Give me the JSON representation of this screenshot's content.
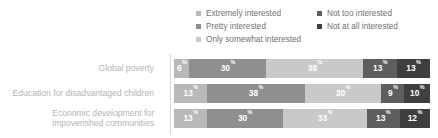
{
  "legend": {
    "columns": [
      {
        "items": [
          {
            "label": "Extremely interested",
            "color": "#b9b9b9"
          },
          {
            "label": "Pretty interested",
            "color": "#8f8f8f"
          },
          {
            "label": "Only somewhat interested",
            "color": "#c9c9c9"
          }
        ]
      },
      {
        "items": [
          {
            "label": "Not too interested",
            "color": "#5e5e5e"
          },
          {
            "label": "Not at all interested",
            "color": "#3f3f3f"
          }
        ]
      }
    ]
  },
  "chart_data": {
    "type": "bar",
    "subtype": "stacked-horizontal-100",
    "title": "",
    "xlabel": "",
    "ylabel": "",
    "xlim": [
      0,
      100
    ],
    "grid": false,
    "legend_position": "top",
    "percent_suffix": "%",
    "categories": [
      "Global poverty",
      "Education for disadvantaged children",
      "Economic development for impoverished communities"
    ],
    "category_lines": [
      [
        "Global poverty"
      ],
      [
        "Education for disadvantaged children"
      ],
      [
        "Economic development for",
        "impoverished communities"
      ]
    ],
    "series": [
      {
        "name": "Extremely interested",
        "color": "#b9b9b9",
        "values": [
          6,
          13,
          13
        ]
      },
      {
        "name": "Pretty interested",
        "color": "#8f8f8f",
        "values": [
          30,
          38,
          30
        ]
      },
      {
        "name": "Only somewhat interested",
        "color": "#c9c9c9",
        "values": [
          38,
          30,
          33
        ]
      },
      {
        "name": "Not too interested",
        "color": "#5e5e5e",
        "values": [
          13,
          9,
          13
        ]
      },
      {
        "name": "Not at all interested",
        "color": "#3f3f3f",
        "values": [
          13,
          10,
          12
        ]
      }
    ],
    "rows": [
      {
        "label": "Global poverty",
        "segments": [
          {
            "name": "Extremely interested",
            "value": 6,
            "label": "6",
            "color": "#b9b9b9"
          },
          {
            "name": "Pretty interested",
            "value": 30,
            "label": "30",
            "color": "#8f8f8f"
          },
          {
            "name": "Only somewhat interested",
            "value": 38,
            "label": "38",
            "color": "#c9c9c9"
          },
          {
            "name": "Not too interested",
            "value": 13,
            "label": "13",
            "color": "#5e5e5e"
          },
          {
            "name": "Not at all interested",
            "value": 13,
            "label": "13",
            "color": "#3f3f3f"
          }
        ]
      },
      {
        "label": "Education for disadvantaged children",
        "segments": [
          {
            "name": "Extremely interested",
            "value": 13,
            "label": "13",
            "color": "#b9b9b9"
          },
          {
            "name": "Pretty interested",
            "value": 38,
            "label": "38",
            "color": "#8f8f8f"
          },
          {
            "name": "Only somewhat interested",
            "value": 30,
            "label": "30",
            "color": "#c9c9c9"
          },
          {
            "name": "Not too interested",
            "value": 9,
            "label": "9",
            "color": "#5e5e5e"
          },
          {
            "name": "Not at all interested",
            "value": 10,
            "label": "10",
            "color": "#3f3f3f"
          }
        ]
      },
      {
        "label": "Economic development for impoverished communities",
        "segments": [
          {
            "name": "Extremely interested",
            "value": 13,
            "label": "13",
            "color": "#b9b9b9"
          },
          {
            "name": "Pretty interested",
            "value": 30,
            "label": "30",
            "color": "#8f8f8f"
          },
          {
            "name": "Only somewhat interested",
            "value": 33,
            "label": "33",
            "color": "#c9c9c9"
          },
          {
            "name": "Not too interested",
            "value": 13,
            "label": "13",
            "color": "#5e5e5e"
          },
          {
            "name": "Not at all interested",
            "value": 12,
            "label": "12",
            "color": "#3f3f3f"
          }
        ]
      }
    ]
  }
}
